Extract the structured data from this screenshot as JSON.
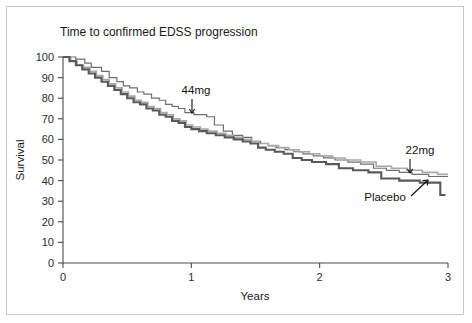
{
  "chart_data": {
    "type": "line",
    "title": "Time to confirmed EDSS progression",
    "xlabel": "Years",
    "ylabel": "Survival",
    "xlim": [
      0,
      3
    ],
    "ylim": [
      0,
      100
    ],
    "xticks": [
      "0",
      "1",
      "2",
      "3"
    ],
    "xtick_values": [
      0,
      1,
      2,
      3
    ],
    "yticks": [
      "0",
      "10",
      "20",
      "30",
      "40",
      "50",
      "60",
      "70",
      "80",
      "90",
      "100"
    ],
    "ytick_values": [
      0,
      10,
      20,
      30,
      40,
      50,
      60,
      70,
      80,
      90,
      100
    ],
    "grid": false,
    "legend_position": "inline-annotations",
    "style": "kaplan-meier step curves",
    "series": [
      {
        "name": "44mg",
        "color": "#6e6e6e",
        "linewidth": 1.2,
        "points": [
          [
            0.0,
            100
          ],
          [
            0.1,
            100
          ],
          [
            0.1,
            99
          ],
          [
            0.17,
            99
          ],
          [
            0.17,
            97
          ],
          [
            0.22,
            97
          ],
          [
            0.22,
            95
          ],
          [
            0.3,
            95
          ],
          [
            0.3,
            93
          ],
          [
            0.36,
            93
          ],
          [
            0.36,
            90
          ],
          [
            0.42,
            90
          ],
          [
            0.42,
            88
          ],
          [
            0.47,
            88
          ],
          [
            0.47,
            86
          ],
          [
            0.52,
            86
          ],
          [
            0.52,
            85
          ],
          [
            0.58,
            85
          ],
          [
            0.58,
            83
          ],
          [
            0.63,
            83
          ],
          [
            0.63,
            82
          ],
          [
            0.69,
            82
          ],
          [
            0.69,
            80
          ],
          [
            0.75,
            80
          ],
          [
            0.75,
            79
          ],
          [
            0.8,
            79
          ],
          [
            0.8,
            77
          ],
          [
            0.85,
            77
          ],
          [
            0.85,
            76
          ],
          [
            0.9,
            76
          ],
          [
            0.9,
            75
          ],
          [
            0.95,
            75
          ],
          [
            0.95,
            73
          ],
          [
            1.02,
            73
          ],
          [
            1.02,
            72
          ],
          [
            1.12,
            72
          ],
          [
            1.12,
            71
          ],
          [
            1.18,
            71
          ],
          [
            1.18,
            67
          ],
          [
            1.25,
            67
          ],
          [
            1.25,
            64
          ],
          [
            1.32,
            64
          ],
          [
            1.32,
            62
          ],
          [
            1.4,
            62
          ],
          [
            1.4,
            61
          ],
          [
            1.47,
            61
          ],
          [
            1.47,
            59
          ],
          [
            1.54,
            59
          ],
          [
            1.54,
            58
          ],
          [
            1.6,
            58
          ],
          [
            1.6,
            57
          ],
          [
            1.66,
            57
          ],
          [
            1.66,
            56
          ],
          [
            1.73,
            56
          ],
          [
            1.73,
            55
          ],
          [
            1.8,
            55
          ],
          [
            1.8,
            54
          ],
          [
            1.87,
            54
          ],
          [
            1.87,
            53
          ],
          [
            1.95,
            53
          ],
          [
            1.95,
            52
          ],
          [
            2.03,
            52
          ],
          [
            2.03,
            51
          ],
          [
            2.12,
            51
          ],
          [
            2.12,
            50
          ],
          [
            2.22,
            50
          ],
          [
            2.22,
            49
          ],
          [
            2.32,
            49
          ],
          [
            2.32,
            48
          ],
          [
            2.42,
            48
          ],
          [
            2.42,
            46
          ],
          [
            2.52,
            46
          ],
          [
            2.52,
            45
          ],
          [
            2.62,
            45
          ],
          [
            2.62,
            44
          ],
          [
            2.72,
            44
          ],
          [
            2.72,
            43
          ],
          [
            2.85,
            43
          ],
          [
            2.85,
            42
          ],
          [
            3.0,
            42
          ]
        ]
      },
      {
        "name": "22mg",
        "color": "#a9a9a9",
        "linewidth": 1.6,
        "points": [
          [
            0.0,
            100
          ],
          [
            0.06,
            100
          ],
          [
            0.06,
            98
          ],
          [
            0.11,
            98
          ],
          [
            0.11,
            96
          ],
          [
            0.16,
            96
          ],
          [
            0.16,
            95
          ],
          [
            0.21,
            95
          ],
          [
            0.21,
            93
          ],
          [
            0.26,
            93
          ],
          [
            0.26,
            91
          ],
          [
            0.31,
            91
          ],
          [
            0.31,
            89
          ],
          [
            0.36,
            89
          ],
          [
            0.36,
            87
          ],
          [
            0.41,
            87
          ],
          [
            0.41,
            85
          ],
          [
            0.46,
            85
          ],
          [
            0.46,
            83
          ],
          [
            0.51,
            83
          ],
          [
            0.51,
            81
          ],
          [
            0.56,
            81
          ],
          [
            0.56,
            79
          ],
          [
            0.61,
            79
          ],
          [
            0.61,
            78
          ],
          [
            0.66,
            78
          ],
          [
            0.66,
            76
          ],
          [
            0.71,
            76
          ],
          [
            0.71,
            75
          ],
          [
            0.76,
            75
          ],
          [
            0.76,
            73
          ],
          [
            0.81,
            73
          ],
          [
            0.81,
            72
          ],
          [
            0.86,
            72
          ],
          [
            0.86,
            70
          ],
          [
            0.91,
            70
          ],
          [
            0.91,
            69
          ],
          [
            0.96,
            69
          ],
          [
            0.96,
            67
          ],
          [
            1.01,
            67
          ],
          [
            1.01,
            66
          ],
          [
            1.07,
            66
          ],
          [
            1.07,
            65
          ],
          [
            1.13,
            65
          ],
          [
            1.13,
            64
          ],
          [
            1.2,
            64
          ],
          [
            1.2,
            63
          ],
          [
            1.27,
            63
          ],
          [
            1.27,
            62
          ],
          [
            1.33,
            62
          ],
          [
            1.33,
            61
          ],
          [
            1.4,
            61
          ],
          [
            1.4,
            60
          ],
          [
            1.47,
            60
          ],
          [
            1.47,
            59
          ],
          [
            1.53,
            59
          ],
          [
            1.53,
            58
          ],
          [
            1.6,
            58
          ],
          [
            1.6,
            57
          ],
          [
            1.68,
            57
          ],
          [
            1.68,
            56
          ],
          [
            1.76,
            56
          ],
          [
            1.76,
            55
          ],
          [
            1.84,
            55
          ],
          [
            1.84,
            54
          ],
          [
            1.92,
            54
          ],
          [
            1.92,
            53
          ],
          [
            2.0,
            53
          ],
          [
            2.0,
            52
          ],
          [
            2.1,
            52
          ],
          [
            2.1,
            51
          ],
          [
            2.2,
            51
          ],
          [
            2.2,
            50
          ],
          [
            2.32,
            50
          ],
          [
            2.32,
            49
          ],
          [
            2.44,
            49
          ],
          [
            2.44,
            47
          ],
          [
            2.56,
            47
          ],
          [
            2.56,
            46
          ],
          [
            2.68,
            46
          ],
          [
            2.68,
            45
          ],
          [
            2.8,
            45
          ],
          [
            2.8,
            44
          ],
          [
            2.92,
            44
          ],
          [
            2.92,
            43
          ],
          [
            3.0,
            43
          ]
        ]
      },
      {
        "name": "Placebo",
        "color": "#595959",
        "linewidth": 2.1,
        "points": [
          [
            0.0,
            100
          ],
          [
            0.05,
            100
          ],
          [
            0.05,
            98
          ],
          [
            0.1,
            98
          ],
          [
            0.1,
            96
          ],
          [
            0.15,
            96
          ],
          [
            0.15,
            94
          ],
          [
            0.2,
            94
          ],
          [
            0.2,
            92
          ],
          [
            0.25,
            92
          ],
          [
            0.25,
            90
          ],
          [
            0.3,
            90
          ],
          [
            0.3,
            88
          ],
          [
            0.35,
            88
          ],
          [
            0.35,
            86
          ],
          [
            0.4,
            86
          ],
          [
            0.4,
            84
          ],
          [
            0.45,
            84
          ],
          [
            0.45,
            82
          ],
          [
            0.5,
            82
          ],
          [
            0.5,
            80
          ],
          [
            0.55,
            80
          ],
          [
            0.55,
            78
          ],
          [
            0.6,
            78
          ],
          [
            0.6,
            77
          ],
          [
            0.65,
            77
          ],
          [
            0.65,
            75
          ],
          [
            0.7,
            75
          ],
          [
            0.7,
            74
          ],
          [
            0.75,
            74
          ],
          [
            0.75,
            72
          ],
          [
            0.8,
            72
          ],
          [
            0.8,
            71
          ],
          [
            0.85,
            71
          ],
          [
            0.85,
            69
          ],
          [
            0.9,
            69
          ],
          [
            0.9,
            68
          ],
          [
            0.95,
            68
          ],
          [
            0.95,
            66
          ],
          [
            1.0,
            66
          ],
          [
            1.0,
            65
          ],
          [
            1.06,
            65
          ],
          [
            1.06,
            64
          ],
          [
            1.12,
            64
          ],
          [
            1.12,
            63
          ],
          [
            1.19,
            63
          ],
          [
            1.19,
            62
          ],
          [
            1.26,
            62
          ],
          [
            1.26,
            61
          ],
          [
            1.33,
            61
          ],
          [
            1.33,
            60
          ],
          [
            1.4,
            60
          ],
          [
            1.4,
            59
          ],
          [
            1.46,
            59
          ],
          [
            1.46,
            58
          ],
          [
            1.52,
            58
          ],
          [
            1.52,
            56
          ],
          [
            1.58,
            56
          ],
          [
            1.58,
            55
          ],
          [
            1.65,
            55
          ],
          [
            1.65,
            54
          ],
          [
            1.72,
            54
          ],
          [
            1.72,
            53
          ],
          [
            1.79,
            53
          ],
          [
            1.79,
            51
          ],
          [
            1.86,
            51
          ],
          [
            1.86,
            50
          ],
          [
            1.94,
            50
          ],
          [
            1.94,
            49
          ],
          [
            2.05,
            49
          ],
          [
            2.05,
            48
          ],
          [
            2.15,
            48
          ],
          [
            2.15,
            46
          ],
          [
            2.26,
            46
          ],
          [
            2.26,
            45
          ],
          [
            2.38,
            45
          ],
          [
            2.38,
            44
          ],
          [
            2.48,
            44
          ],
          [
            2.48,
            41
          ],
          [
            2.62,
            41
          ],
          [
            2.62,
            40
          ],
          [
            2.78,
            40
          ],
          [
            2.78,
            39
          ],
          [
            2.94,
            39
          ],
          [
            2.94,
            33
          ],
          [
            2.98,
            33
          ]
        ]
      }
    ],
    "annotations": [
      {
        "label": "44mg",
        "target_x": 1.02,
        "target_y": 73
      },
      {
        "label": "22mg",
        "target_x": 2.8,
        "target_y": 44
      },
      {
        "label": "Placebo",
        "target_x": 2.92,
        "target_y": 39
      }
    ]
  },
  "figure": {
    "border_color": "#c9c9c9",
    "background": "#ffffff"
  }
}
